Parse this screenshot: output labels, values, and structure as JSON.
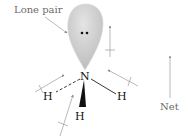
{
  "diagram": {
    "molecule": "NH3",
    "labels": {
      "lone_pair": "Lone pair",
      "net": "Net"
    },
    "atoms": {
      "central": "N",
      "h_left": "H",
      "h_right": "H",
      "h_front": "H"
    },
    "colors": {
      "lobe_fill": "#c9c9c9",
      "lobe_edge": "#e6e6e6",
      "dipole_arrow": "#8a8a8a",
      "bond": "#222222",
      "text_label": "#6b6b6b"
    }
  }
}
